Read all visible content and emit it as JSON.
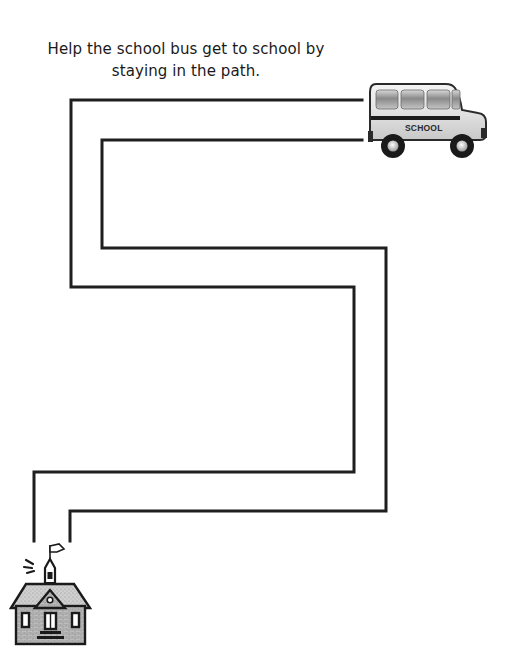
{
  "worksheet": {
    "instructions": {
      "line1": "Help the school bus get to school by",
      "line2": "staying in the path."
    },
    "start": {
      "icon": "school-bus-icon",
      "label": "SCHOOL"
    },
    "finish": {
      "icon": "schoolhouse-icon"
    },
    "maze": {
      "type": "path-tracing",
      "line_color": "#1f1f1f"
    }
  }
}
